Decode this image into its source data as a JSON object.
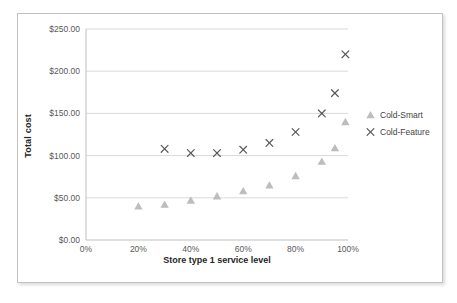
{
  "chart_data": {
    "type": "scatter",
    "title": "",
    "xlabel": "Store type 1 service level",
    "ylabel": "Total cost",
    "xlim": [
      0,
      100
    ],
    "ylim": [
      0,
      250
    ],
    "x_ticks": [
      0,
      20,
      40,
      60,
      80,
      100
    ],
    "x_tick_labels": [
      "0%",
      "20%",
      "40%",
      "60%",
      "80%",
      "100%"
    ],
    "y_ticks": [
      0,
      50,
      100,
      150,
      200,
      250
    ],
    "y_tick_labels": [
      "$0.00",
      "$50.00",
      "$100.00",
      "$150.00",
      "$200.00",
      "$250.00"
    ],
    "grid": "horizontal",
    "legend_position": "right",
    "series": [
      {
        "name": "Cold-Smart",
        "marker": "triangle",
        "color": "#bdbdbd",
        "points": [
          [
            20,
            40
          ],
          [
            30,
            42
          ],
          [
            40,
            47
          ],
          [
            50,
            52
          ],
          [
            60,
            58
          ],
          [
            70,
            65
          ],
          [
            80,
            76
          ],
          [
            90,
            93
          ],
          [
            95,
            109
          ],
          [
            99,
            140
          ]
        ]
      },
      {
        "name": "Cold-Feature",
        "marker": "x",
        "color": "#595959",
        "points": [
          [
            30,
            108
          ],
          [
            40,
            103
          ],
          [
            50,
            103
          ],
          [
            60,
            107
          ],
          [
            70,
            115
          ],
          [
            80,
            128
          ],
          [
            90,
            150
          ],
          [
            95,
            174
          ],
          [
            99,
            220
          ]
        ]
      }
    ]
  },
  "colors": {
    "background": "#ffffff",
    "frame_border": "#c2c2c2",
    "gridline": "#d9d9d9",
    "axis_line": "#bfbfbf",
    "tick_label": "#595959",
    "axis_title": "#262626",
    "legend_text": "#444444"
  }
}
